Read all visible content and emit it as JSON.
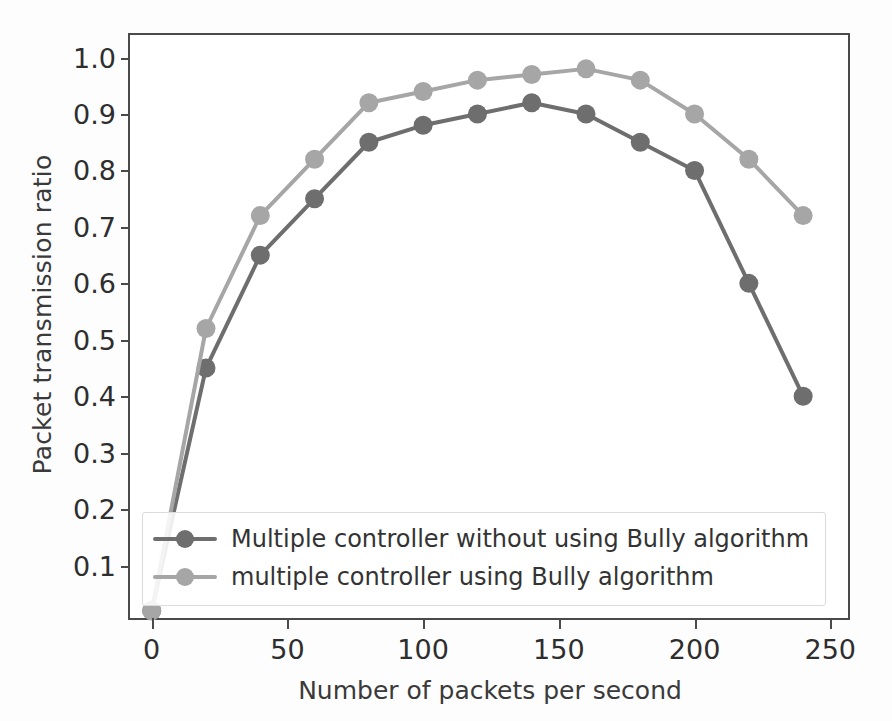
{
  "chart_data": {
    "type": "line",
    "title": "",
    "xlabel": "Number of packets per second",
    "ylabel": "Packet transmission ratio",
    "x": [
      0,
      20,
      40,
      60,
      80,
      100,
      120,
      140,
      160,
      180,
      200,
      220,
      240
    ],
    "xlim": [
      -8,
      258
    ],
    "ylim": [
      0.0,
      1.04
    ],
    "xticks": [
      0,
      50,
      100,
      150,
      200,
      250
    ],
    "xtick_labels": [
      "0",
      "50",
      "100",
      "150",
      "200",
      "250"
    ],
    "yticks": [
      0.1,
      0.2,
      0.3,
      0.4,
      0.5,
      0.6,
      0.7,
      0.8,
      0.9,
      1.0
    ],
    "ytick_labels": [
      "0.1",
      "0.2",
      "0.3",
      "0.4",
      "0.5",
      "0.6",
      "0.7",
      "0.8",
      "0.9",
      "1.0"
    ],
    "grid": false,
    "legend_position": "lower left",
    "series": [
      {
        "name": "Multiple controller without using Bully algorithm",
        "color": "#6e6e6e",
        "marker": "o",
        "values": [
          0.02,
          0.45,
          0.65,
          0.75,
          0.85,
          0.88,
          0.9,
          0.92,
          0.9,
          0.85,
          0.8,
          0.6,
          0.4
        ]
      },
      {
        "name": "multiple controller using Bully algorithm",
        "color": "#a6a6a6",
        "marker": "o",
        "values": [
          0.02,
          0.52,
          0.72,
          0.82,
          0.92,
          0.94,
          0.96,
          0.97,
          0.98,
          0.96,
          0.9,
          0.82,
          0.72
        ]
      }
    ]
  },
  "figure": {
    "background_color": "#ffffff",
    "axis_color": "#4a4a4a",
    "text_color": "#2e2e2e"
  }
}
